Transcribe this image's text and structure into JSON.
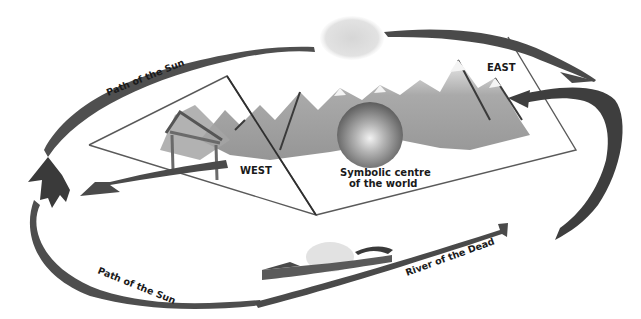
{
  "diagram": {
    "type": "cosmological-diagram",
    "colors": {
      "background": "#ffffff",
      "arrow": "#4a4a4a",
      "arrow_dark": "#3a3a3a",
      "plane_line": "#5a5a5a",
      "mountain": "#8c8c8c",
      "mountain_light": "#c8c8c8",
      "sun_cloud": "#d8d8d8",
      "sphere": "#7a7a7a",
      "label": "#1a1a1a"
    },
    "labels": {
      "path_of_sun_top": "Path of the Sun",
      "east": "EAST",
      "west": "WEST",
      "centre_line1": "Symbolic centre",
      "centre_line2": "of the world",
      "path_of_sun_bottom": "Path of the Sun",
      "river_of_dead": "River of the Dead"
    },
    "elements": [
      "sun-cloud-top",
      "mountain-range",
      "symbolic-sphere",
      "west-gate",
      "boat-on-river",
      "sun-path-arrow-top",
      "sun-path-arrow-east",
      "sun-path-arrow-west",
      "sun-path-arrow-bottom",
      "river-arrow",
      "world-planes"
    ]
  }
}
